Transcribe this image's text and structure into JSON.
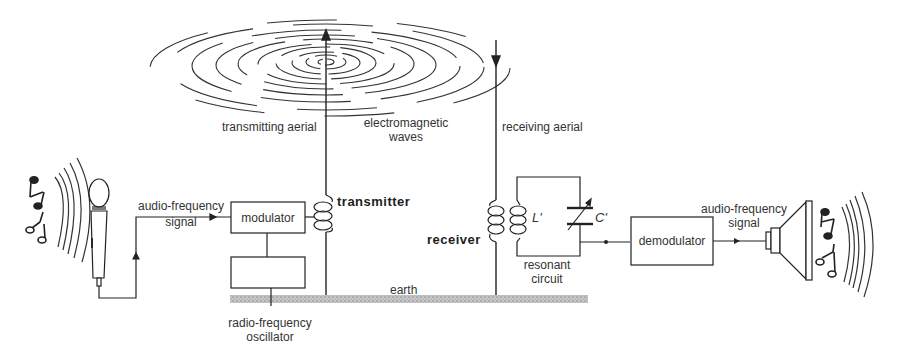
{
  "diagram": {
    "type": "radio transmission block diagram",
    "labels": {
      "transmitting_aerial": "transmitting aerial",
      "electromagnetic_waves": "electromagnetic\nwaves",
      "em_line1": "electromagnetic",
      "em_line2": "waves",
      "receiving_aerial": "receiving aerial",
      "audio_in_line1": "audio-frequency",
      "audio_in_line2": "signal",
      "modulator": "modulator",
      "transmitter": "transmitter",
      "receiver": "receiver",
      "inductor": "L'",
      "capacitor": "C'",
      "resonant_line1": "resonant",
      "resonant_line2": "circuit",
      "demodulator": "demodulator",
      "audio_out_line1": "audio-frequency",
      "audio_out_line2": "signal",
      "earth": "earth",
      "oscillator_line1": "radio-frequency",
      "oscillator_line2": "oscillator"
    },
    "nodes": [
      {
        "id": "microphone",
        "kind": "input device"
      },
      {
        "id": "modulator",
        "kind": "block"
      },
      {
        "id": "oscillator",
        "kind": "block",
        "label": "radio-frequency oscillator"
      },
      {
        "id": "transmitter-coil",
        "kind": "coil"
      },
      {
        "id": "transmitting-aerial",
        "kind": "antenna"
      },
      {
        "id": "receiving-aerial",
        "kind": "antenna"
      },
      {
        "id": "receiver-coil",
        "kind": "coil"
      },
      {
        "id": "resonant-circuit",
        "kind": "LC circuit"
      },
      {
        "id": "demodulator",
        "kind": "block"
      },
      {
        "id": "loudspeaker",
        "kind": "output device"
      },
      {
        "id": "earth",
        "kind": "ground"
      }
    ],
    "colors": {
      "line": "#2a2a2a",
      "earth": "#b5b5b5",
      "background": "#ffffff"
    }
  }
}
